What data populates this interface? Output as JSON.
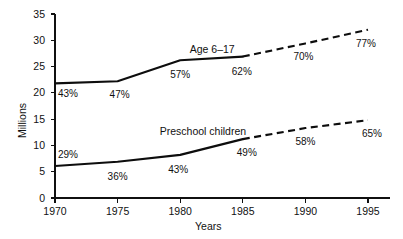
{
  "chart_data": {
    "type": "line",
    "title": "",
    "xlabel": "Years",
    "ylabel": "Millions",
    "x": [
      1970,
      1975,
      1980,
      1985,
      1990,
      1995
    ],
    "xlim": [
      1970,
      1995
    ],
    "ylim": [
      0,
      35
    ],
    "ytick_labels": [
      "0",
      "5",
      "10",
      "15",
      "20",
      "25",
      "30",
      "35"
    ],
    "yticks": [
      0,
      5,
      10,
      15,
      20,
      25,
      30,
      35
    ],
    "xtick_labels": [
      "1970",
      "1975",
      "1980",
      "1985",
      "1990",
      "1995"
    ],
    "grid": false,
    "legend": "inline-labels",
    "series": [
      {
        "name": "Age 6–17",
        "values": [
          21.8,
          22.2,
          26.2,
          26.9,
          29.4,
          32.0
        ],
        "solid_through": 1985,
        "dashed_from": 1985,
        "point_labels": [
          "43%",
          "47%",
          "57%",
          "62%",
          "70%",
          "77%"
        ]
      },
      {
        "name": "Preschool children",
        "values": [
          6.1,
          6.9,
          8.2,
          11.2,
          13.3,
          14.8
        ],
        "solid_through": 1985,
        "dashed_from": 1985,
        "point_labels": [
          "29%",
          "36%",
          "43%",
          "49%",
          "58%",
          "65%"
        ]
      }
    ],
    "annotations": [
      {
        "text": "Age 6–17",
        "x": 1983.0,
        "y": 28.2
      },
      {
        "text": "Preschool children",
        "x": 1980.6,
        "y": 12.6
      }
    ],
    "colors": {
      "line": "#0d0d0d",
      "axis": "#101010",
      "text": "#111111",
      "background": "#ffffff"
    }
  }
}
